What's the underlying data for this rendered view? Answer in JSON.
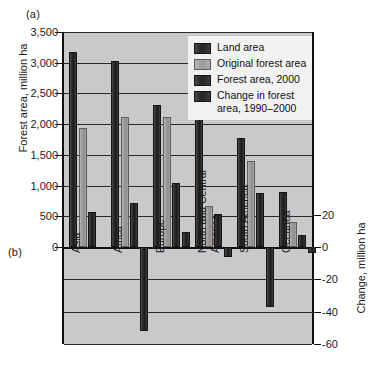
{
  "panels": {
    "a": "(a)",
    "b": "(b)"
  },
  "axes": {
    "left_title": "Forest area, million ha",
    "right_title": "Change, million ha",
    "left_ticks": [
      "3,500",
      "3,000",
      "2,500",
      "2,000",
      "1,500",
      "1,000",
      "500",
      "0"
    ],
    "right_ticks": [
      "20",
      "0",
      "-20",
      "-40",
      "-60"
    ]
  },
  "legend": {
    "items": [
      {
        "label": "Land area",
        "color": "#222222"
      },
      {
        "label": "Original forest area",
        "color": "#9a9a9a"
      },
      {
        "label": "Forest area, 2000",
        "color": "#222222"
      },
      {
        "label": "Change in forest area, 1990–2000",
        "line1": "Change in forest",
        "line2": "area, 1990–2000",
        "color": "#222222"
      }
    ]
  },
  "categories_display": [
    {
      "line1": "Asia",
      "line2": ""
    },
    {
      "line1": "Africa",
      "line2": ""
    },
    {
      "line1": "Europe",
      "line2": ""
    },
    {
      "line1": "North and Central",
      "line2": "America"
    },
    {
      "line1": "South America",
      "line2": ""
    },
    {
      "line1": "Oceanea",
      "line2": ""
    }
  ],
  "chart_data": {
    "type": "bar",
    "title": "",
    "xlabel": "",
    "ylabel": "Forest area, million ha",
    "ylabel_secondary": "Change, million ha",
    "ylim": [
      0,
      3500
    ],
    "ylim_secondary": [
      -60,
      20
    ],
    "grid": true,
    "legend_position": "top-right",
    "categories": [
      "Asia",
      "Africa",
      "Europe",
      "North and Central America",
      "South America",
      "Oceanea"
    ],
    "series": [
      {
        "name": "Land area",
        "axis": "left",
        "unit": "million ha",
        "values": [
          3180,
          3030,
          2310,
          2080,
          1780,
          890
        ]
      },
      {
        "name": "Original forest area",
        "axis": "left",
        "unit": "million ha",
        "values": [
          1930,
          2110,
          2110,
          660,
          1400,
          400
        ]
      },
      {
        "name": "Forest area, 2000",
        "axis": "left",
        "unit": "million ha",
        "values": [
          570,
          720,
          1040,
          530,
          880,
          190
        ]
      },
      {
        "name": "Change in forest area, 1990–2000",
        "axis": "right",
        "unit": "million ha",
        "values": [
          -1,
          -52,
          9,
          -6,
          -37,
          -4
        ]
      }
    ]
  }
}
